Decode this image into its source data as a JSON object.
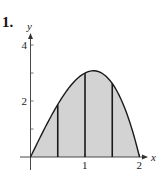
{
  "problem": {
    "number": "1."
  },
  "chart_data": {
    "type": "area",
    "title": "",
    "function": "y = x(4 - x^2)",
    "xlabel": "x",
    "ylabel": "y",
    "xlim": [
      0,
      2
    ],
    "ylim": [
      0,
      4
    ],
    "x_ticks": [
      1,
      2
    ],
    "x_tick_labels": [
      "1",
      "2"
    ],
    "y_ticks": [
      1,
      2,
      3,
      4
    ],
    "y_tick_labels": [
      "",
      "2",
      "",
      "4"
    ],
    "grid": false,
    "legend": "none",
    "curve_points": {
      "x": [
        0,
        0.25,
        0.5,
        0.75,
        1.0,
        1.155,
        1.25,
        1.5,
        1.75,
        2.0
      ],
      "y": [
        0,
        0.984,
        1.875,
        2.578,
        3.0,
        3.079,
        3.047,
        2.625,
        1.641,
        0
      ]
    },
    "shaded_region": {
      "from": 0,
      "to": 2,
      "color": "#d3d3d3"
    },
    "vertical_lines": [
      {
        "x": 0.5,
        "height": 1.875
      },
      {
        "x": 1.0,
        "height": 3.0
      },
      {
        "x": 1.5,
        "height": 2.625
      }
    ],
    "colors": {
      "curve": "#1a1a1a",
      "fill": "#d3d3d3",
      "axes": "#333333"
    }
  }
}
